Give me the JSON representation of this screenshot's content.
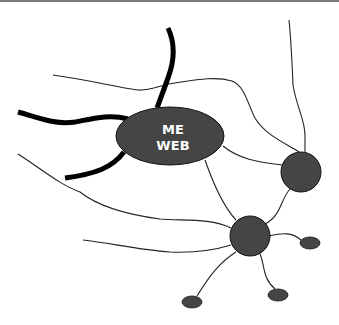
{
  "diagram": {
    "central_node": {
      "label_line1": "ME",
      "label_line2": "WEB",
      "fill": "#454545"
    },
    "colors": {
      "node_fill": "#454545",
      "line": "#222222",
      "thick_line": "#000000",
      "background": "#ffffff"
    },
    "nodes": [
      {
        "id": "me-web",
        "shape": "ellipse",
        "cx": 170,
        "cy": 136,
        "rx": 54,
        "ry": 29
      },
      {
        "id": "hub-right",
        "shape": "circle",
        "cx": 301,
        "cy": 172,
        "r": 20
      },
      {
        "id": "hub-bottom",
        "shape": "circle",
        "cx": 250,
        "cy": 236,
        "r": 20
      },
      {
        "id": "leaf-right",
        "shape": "ellipse",
        "cx": 310,
        "cy": 243,
        "rx": 10,
        "ry": 6
      },
      {
        "id": "leaf-bottom-right",
        "shape": "ellipse",
        "cx": 278,
        "cy": 295,
        "rx": 10,
        "ry": 6
      },
      {
        "id": "leaf-bottom-left",
        "shape": "ellipse",
        "cx": 192,
        "cy": 302,
        "rx": 10,
        "ry": 6
      }
    ]
  }
}
